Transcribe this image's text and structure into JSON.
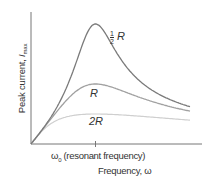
{
  "chart_data": {
    "type": "line",
    "title": "",
    "xlabel": "Frequency, ω",
    "ylabel": "Peak current, I_max",
    "ylabel_parts": {
      "text": "Peak current, ",
      "symbol": "I",
      "subscript": "max"
    },
    "x_ticks": [
      {
        "label": "ω0 (resonant frequency)",
        "position": "resonance"
      }
    ],
    "x_tick_label_parts": {
      "symbol": "ω",
      "subscript": "0",
      "rest": " (resonant frequency)"
    },
    "grid": false,
    "legend": "inline labels on curves",
    "x": [
      0,
      0.1,
      0.2,
      0.3,
      0.4,
      0.5,
      0.55,
      0.6,
      0.65,
      0.7,
      0.8,
      0.9,
      1.0,
      1.1,
      1.2,
      1.3,
      1.4,
      1.5,
      1.6
    ],
    "series": [
      {
        "name": "1/2 R",
        "label_parts": {
          "num": "1",
          "den": "2",
          "sym": "R"
        },
        "color": "#7a7a7a",
        "peak_relative": 1.0,
        "description": "tallest, sharpest peak at ω0"
      },
      {
        "name": "R",
        "label_parts": {
          "sym": "R"
        },
        "color": "#9c9c9c",
        "peak_relative": 0.5,
        "description": "medium peak at ω0"
      },
      {
        "name": "2R",
        "label_parts": {
          "sym": "2R"
        },
        "color": "#cfcfcf",
        "peak_relative": 0.25,
        "description": "broad, low peak at ω0"
      }
    ],
    "annotations": [
      "1/2 R",
      "R",
      "2R"
    ],
    "axis_ranges": {
      "x": [
        0,
        1.6
      ],
      "y": [
        0,
        1.1
      ]
    }
  },
  "labels": {
    "ylabel": "Peak current, ",
    "ylabel_sym": "I",
    "ylabel_sub": "max",
    "tick_sym": "ω",
    "tick_sub": "0",
    "tick_rest": " (resonant frequency)",
    "xlabel": "Frequency, ω",
    "half_num": "1",
    "half_den": "2",
    "half_sym": "R",
    "r": "R",
    "r2": "2R"
  }
}
